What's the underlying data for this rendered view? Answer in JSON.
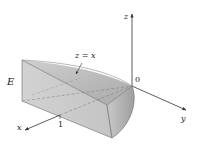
{
  "figure": {
    "solid_label": "E",
    "surface_label": "z = x",
    "origin_label": "0",
    "tick_label": "1",
    "axes": {
      "x": "x",
      "y": "y",
      "z": "z"
    },
    "colors": {
      "solid_fill": "#c8c8c8",
      "solid_side": "#d6d6d6",
      "solid_top": "#b9b9b9",
      "edge": "#6a6a6a",
      "axis": "#333333"
    }
  }
}
